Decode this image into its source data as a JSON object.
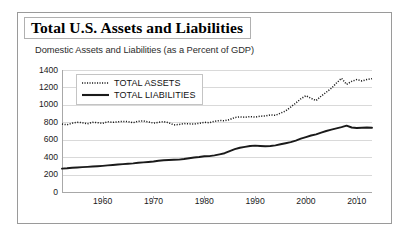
{
  "figure": {
    "title": "Total U.S. Assets and Liabilities",
    "subtitle": "Domestic Assets and Liabilities (as a Percent of GDP)"
  },
  "colors": {
    "assets_line": "#1a1a1a",
    "liabilities_line": "#1a1a1a",
    "gridline": "#d9d9d9",
    "axis": "#a8a8a8",
    "frame": "#9a9a9a",
    "text": "#111111"
  },
  "legend": {
    "position": "top-left-inside",
    "items": [
      {
        "label": "TOTAL ASSETS",
        "style": "dotted"
      },
      {
        "label": "TOTAL LIABILITIES",
        "style": "solid"
      }
    ]
  },
  "chart_data": {
    "type": "line",
    "title": "Total U.S. Assets and Liabilities",
    "subtitle": "Domestic Assets and Liabilities (as a Percent of GDP)",
    "xlabel": "",
    "ylabel": "",
    "xlim": [
      1952,
      2013
    ],
    "ylim": [
      0,
      1400
    ],
    "yticks": [
      0,
      200,
      400,
      600,
      800,
      1000,
      1200,
      1400
    ],
    "ytick_labels": [
      "0",
      "200",
      "400",
      "600",
      "800",
      "1000",
      "1200",
      "1400"
    ],
    "xticks": [
      1960,
      1970,
      1980,
      1990,
      2000,
      2010
    ],
    "xtick_labels": [
      "1960",
      "1970",
      "1980",
      "1990",
      "2000",
      "2010"
    ],
    "grid": "horizontal",
    "legend_position": "upper left",
    "x": [
      1952,
      1953,
      1954,
      1955,
      1956,
      1957,
      1958,
      1959,
      1960,
      1961,
      1962,
      1963,
      1964,
      1965,
      1966,
      1967,
      1968,
      1969,
      1970,
      1971,
      1972,
      1973,
      1974,
      1975,
      1976,
      1977,
      1978,
      1979,
      1980,
      1981,
      1982,
      1983,
      1984,
      1985,
      1986,
      1987,
      1988,
      1989,
      1990,
      1991,
      1992,
      1993,
      1994,
      1995,
      1996,
      1997,
      1998,
      1999,
      2000,
      2001,
      2002,
      2003,
      2004,
      2005,
      2006,
      2007,
      2008,
      2009,
      2010,
      2011,
      2012,
      2013
    ],
    "series": [
      {
        "name": "TOTAL ASSETS",
        "style": "dotted",
        "values": [
          780,
          772,
          790,
          800,
          795,
          782,
          800,
          795,
          788,
          806,
          800,
          805,
          810,
          808,
          795,
          812,
          815,
          805,
          790,
          800,
          808,
          795,
          770,
          775,
          785,
          782,
          780,
          788,
          800,
          795,
          812,
          820,
          818,
          832,
          855,
          862,
          858,
          865,
          860,
          870,
          872,
          885,
          880,
          905,
          930,
          975,
          1020,
          1070,
          1105,
          1075,
          1050,
          1100,
          1145,
          1190,
          1250,
          1305,
          1235,
          1270,
          1290,
          1275,
          1290,
          1300
        ]
      },
      {
        "name": "TOTAL LIABILITIES",
        "style": "solid",
        "values": [
          268,
          272,
          278,
          282,
          285,
          288,
          292,
          296,
          300,
          305,
          310,
          315,
          320,
          325,
          328,
          335,
          340,
          345,
          350,
          358,
          365,
          368,
          370,
          372,
          378,
          388,
          396,
          402,
          410,
          412,
          420,
          432,
          445,
          470,
          492,
          508,
          518,
          528,
          532,
          528,
          525,
          528,
          535,
          548,
          560,
          572,
          590,
          612,
          630,
          648,
          662,
          682,
          700,
          715,
          730,
          745,
          762,
          740,
          735,
          738,
          740,
          738
        ]
      }
    ]
  }
}
